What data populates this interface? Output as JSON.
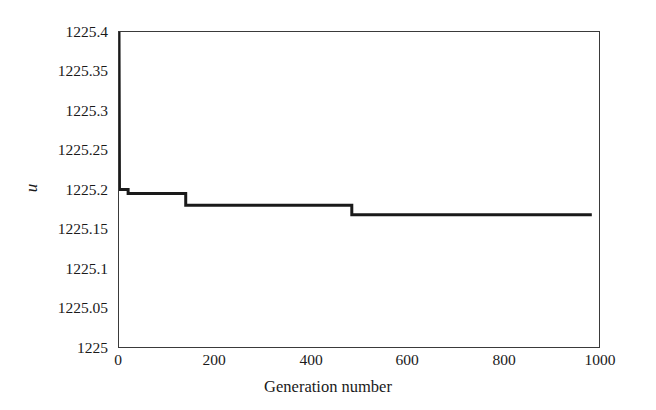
{
  "chart_data": {
    "type": "line",
    "title": "",
    "xlabel": "Generation number",
    "ylabel": "u",
    "xlim": [
      0,
      1000
    ],
    "ylim": [
      1225,
      1225.4
    ],
    "xticks": [
      0,
      200,
      400,
      600,
      800,
      1000
    ],
    "xtick_labels": [
      "0",
      "200",
      "400",
      "600",
      "800",
      "1000"
    ],
    "yticks": [
      1225,
      1225.05,
      1225.1,
      1225.15,
      1225.2,
      1225.25,
      1225.3,
      1225.35,
      1225.4
    ],
    "ytick_labels": [
      "1225",
      "1225.05",
      "1225.1",
      "1225.15",
      "1225.2",
      "1225.25",
      "1225.3",
      "1225.35",
      "1225.4"
    ],
    "grid": false,
    "legend": null,
    "line_color": "#1a1a1a",
    "line_width": 3,
    "step_style": "post",
    "series": [
      {
        "name": "best objective value",
        "x": [
          0,
          1,
          19,
          19,
          139,
          139,
          485,
          485,
          985
        ],
        "y": [
          1225.4,
          1225.2,
          1225.2,
          1225.195,
          1225.195,
          1225.18,
          1225.18,
          1225.168,
          1225.168
        ]
      }
    ],
    "annotations": []
  },
  "figure": {
    "background_color": "#ffffff",
    "axis_color": "#3a3a3a"
  }
}
